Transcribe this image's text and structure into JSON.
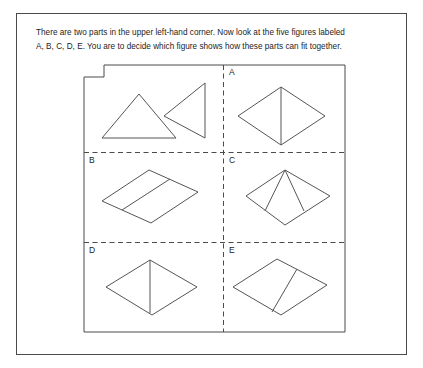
{
  "instructions": {
    "line1": "There are two parts in the upper left-hand corner. Now look at the five figures labeled",
    "line2": "A, B, C, D, E. You are to decide which figure shows how these parts can fit together."
  },
  "panels": [
    {
      "id": "parts",
      "label": "",
      "description": "two parts: upward-pointing triangle and left-pointing right triangle"
    },
    {
      "id": "A",
      "label": "A",
      "description": "rhombus with vertical line from top vertex to bottom vertex"
    },
    {
      "id": "B",
      "label": "B",
      "description": "parallelogram divided by a line parallel to its slanted sides"
    },
    {
      "id": "C",
      "label": "C",
      "description": "rhombus with two lines from the top vertex to the lower edges"
    },
    {
      "id": "D",
      "label": "D",
      "description": "rhombus with a vertical line left of center"
    },
    {
      "id": "E",
      "label": "E",
      "description": "rhombus with a slanted line from upper-right edge to bottom vertex"
    }
  ],
  "colors": {
    "stroke": "#4b4b4b",
    "shape_stroke": "#555555",
    "text": "#1c1c1c",
    "background": "#ffffff"
  }
}
